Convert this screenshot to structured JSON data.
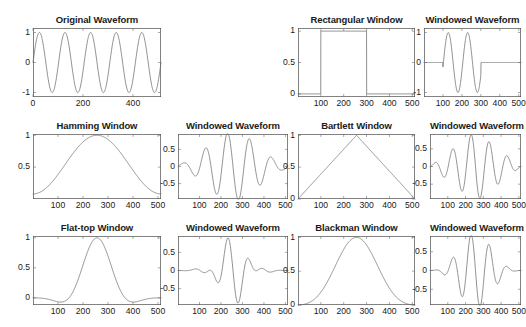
{
  "figure": {
    "background": "#ffffff",
    "line_color": "#6b6b6b",
    "axis_color": "#4d4d4d",
    "text_color": "#1a1a1a",
    "rows": 3,
    "cols": 4
  },
  "chart_data": [
    {
      "id": "original-waveform",
      "type": "line",
      "title": "Original Waveform",
      "xlabel": "",
      "ylabel": "",
      "xlim": [
        0,
        512
      ],
      "ylim": [
        -1.15,
        1.15
      ],
      "xticks": [
        0,
        200,
        400
      ],
      "xticklabels": [
        "0",
        "200",
        "400"
      ],
      "yticks": [
        -1,
        0,
        1
      ],
      "yticklabels": [
        "-1",
        "0",
        "1"
      ],
      "grid": false,
      "series": [
        {
          "name": "sine",
          "formula": "sin",
          "amplitude": 1.0,
          "cycles": 5,
          "phase": 0,
          "window": "none"
        }
      ]
    },
    {
      "id": "rectangular-window",
      "type": "line",
      "title": "Rectangular Window",
      "xlabel": "",
      "ylabel": "",
      "xlim": [
        0,
        512
      ],
      "ylim": [
        -0.05,
        1.05
      ],
      "xticks": [
        100,
        200,
        300,
        400,
        500
      ],
      "xticklabels": [
        "100",
        "200",
        "300",
        "400",
        "500"
      ],
      "yticks": [
        0,
        0.5,
        1
      ],
      "yticklabels": [
        "0",
        "0.5",
        "1"
      ],
      "grid": false,
      "series": [
        {
          "name": "rectangular",
          "formula": "window",
          "window": "rectangular",
          "start": 100,
          "stop": 300
        }
      ]
    },
    {
      "id": "rectangular-windowed-waveform",
      "type": "line",
      "title": "Windowed Waveform",
      "xlabel": "",
      "ylabel": "",
      "xlim": [
        0,
        512
      ],
      "ylim": [
        -1.15,
        1.15
      ],
      "xticks": [
        100,
        200,
        300,
        400,
        500
      ],
      "xticklabels": [
        "100",
        "200",
        "300",
        "400",
        "500"
      ],
      "yticks": [
        -1,
        0,
        1
      ],
      "yticklabels": [
        "-1",
        "0",
        "1"
      ],
      "grid": false,
      "series": [
        {
          "name": "sine-x-rectangular",
          "formula": "sin",
          "amplitude": 1.0,
          "cycles": 5,
          "phase": 0,
          "window": "rectangular",
          "start": 100,
          "stop": 300
        }
      ]
    },
    {
      "id": "hamming-window",
      "type": "line",
      "title": "Hamming Window",
      "xlabel": "",
      "ylabel": "",
      "xlim": [
        0,
        512
      ],
      "ylim": [
        0.0,
        1.02
      ],
      "xticks": [
        100,
        200,
        300,
        400,
        500
      ],
      "xticklabels": [
        "100",
        "200",
        "300",
        "400",
        "500"
      ],
      "yticks": [
        0.5,
        1
      ],
      "yticklabels": [
        "0.5",
        "1"
      ],
      "grid": false,
      "series": [
        {
          "name": "hamming",
          "formula": "window",
          "window": "hamming"
        }
      ]
    },
    {
      "id": "hamming-windowed-waveform",
      "type": "line",
      "title": "Windowed Waveform",
      "xlabel": "",
      "ylabel": "",
      "xlim": [
        0,
        512
      ],
      "ylim": [
        -0.95,
        0.95
      ],
      "xticks": [
        100,
        200,
        300,
        400,
        500
      ],
      "xticklabels": [
        "100",
        "200",
        "300",
        "400",
        "500"
      ],
      "yticks": [
        -0.5,
        0,
        0.5
      ],
      "yticklabels": [
        "-0.5",
        "0",
        "0.5"
      ],
      "grid": false,
      "series": [
        {
          "name": "sine-x-hamming",
          "formula": "sin",
          "amplitude": 1.0,
          "cycles": 5,
          "phase": 0,
          "window": "hamming"
        }
      ]
    },
    {
      "id": "bartlett-window",
      "type": "line",
      "title": "Bartlett Window",
      "xlabel": "",
      "ylabel": "",
      "xlim": [
        0,
        512
      ],
      "ylim": [
        0,
        1.02
      ],
      "xticks": [
        100,
        200,
        300,
        400,
        500
      ],
      "xticklabels": [
        "100",
        "200",
        "300",
        "400",
        "500"
      ],
      "yticks": [
        0,
        0.5,
        1
      ],
      "yticklabels": [
        "0",
        "0.5",
        "1"
      ],
      "grid": false,
      "series": [
        {
          "name": "bartlett",
          "formula": "window",
          "window": "bartlett"
        }
      ]
    },
    {
      "id": "bartlett-windowed-waveform",
      "type": "line",
      "title": "Windowed Waveform",
      "xlabel": "",
      "ylabel": "",
      "xlim": [
        0,
        512
      ],
      "ylim": [
        -0.92,
        0.92
      ],
      "xticks": [
        100,
        200,
        300,
        400,
        500
      ],
      "xticklabels": [
        "100",
        "200",
        "300",
        "400",
        "500"
      ],
      "yticks": [
        -0.5,
        0,
        0.5
      ],
      "yticklabels": [
        "-0.5",
        "0",
        "0.5"
      ],
      "grid": false,
      "series": [
        {
          "name": "sine-x-bartlett",
          "formula": "sin",
          "amplitude": 1.0,
          "cycles": 5,
          "phase": 0,
          "window": "bartlett"
        }
      ]
    },
    {
      "id": "flat-top-window",
      "type": "line",
      "title": "Flat-top Window",
      "xlabel": "",
      "ylabel": "",
      "xlim": [
        0,
        512
      ],
      "ylim": [
        -0.12,
        1.03
      ],
      "xticks": [
        100,
        200,
        300,
        400,
        500
      ],
      "xticklabels": [
        "100",
        "200",
        "300",
        "400",
        "500"
      ],
      "yticks": [
        0,
        0.5,
        1
      ],
      "yticklabels": [
        "0",
        "0.5",
        "1"
      ],
      "grid": false,
      "series": [
        {
          "name": "flattop",
          "formula": "window",
          "window": "flattop"
        }
      ]
    },
    {
      "id": "flattop-windowed-waveform",
      "type": "line",
      "title": "Windowed Waveform",
      "xlabel": "",
      "ylabel": "",
      "xlim": [
        0,
        512
      ],
      "ylim": [
        -0.95,
        0.95
      ],
      "xticks": [
        100,
        200,
        300,
        400,
        500
      ],
      "xticklabels": [
        "100",
        "200",
        "300",
        "400",
        "500"
      ],
      "yticks": [
        -0.5,
        0,
        0.5
      ],
      "yticklabels": [
        "-0.5",
        "0",
        "0.5"
      ],
      "grid": false,
      "series": [
        {
          "name": "sine-x-flattop",
          "formula": "sin",
          "amplitude": 1.0,
          "cycles": 5,
          "phase": 0,
          "window": "flattop"
        }
      ]
    },
    {
      "id": "blackman-window",
      "type": "line",
      "title": "Blackman Window",
      "xlabel": "",
      "ylabel": "",
      "xlim": [
        0,
        512
      ],
      "ylim": [
        0,
        1.02
      ],
      "xticks": [
        100,
        200,
        300,
        400,
        500
      ],
      "xticklabels": [
        "100",
        "200",
        "300",
        "400",
        "500"
      ],
      "yticks": [
        0,
        0.5,
        1
      ],
      "yticklabels": [
        "0",
        "0.5",
        "1"
      ],
      "grid": false,
      "series": [
        {
          "name": "blackman",
          "formula": "window",
          "window": "blackman"
        }
      ]
    },
    {
      "id": "blackman-windowed-waveform",
      "type": "line",
      "title": "Windowed Waveform",
      "xlabel": "",
      "ylabel": "",
      "xlim": [
        0,
        512
      ],
      "ylim": [
        -0.92,
        0.92
      ],
      "xticks": [
        100,
        200,
        300,
        400,
        500
      ],
      "xticklabels": [
        "100",
        "200",
        "300",
        "400",
        "500"
      ],
      "yticks": [
        -0.5,
        0,
        0.5
      ],
      "yticklabels": [
        "-0.5",
        "0",
        "0.5"
      ],
      "grid": false,
      "series": [
        {
          "name": "sine-x-blackman",
          "formula": "sin",
          "amplitude": 1.0,
          "cycles": 5,
          "phase": 0,
          "window": "blackman"
        }
      ]
    }
  ],
  "layout": {
    "cells": [
      {
        "chart": 0,
        "left": 33,
        "top": 14,
        "width": 128,
        "height": 96,
        "empty": false
      },
      {
        "chart": null,
        "left": 166,
        "top": 14,
        "width": 128,
        "height": 96,
        "empty": true
      },
      {
        "chart": 1,
        "left": 298,
        "top": 14,
        "width": 117,
        "height": 96,
        "empty": false
      },
      {
        "chart": 2,
        "left": 424,
        "top": 14,
        "width": 97,
        "height": 96,
        "empty": false
      },
      {
        "chart": 3,
        "left": 33,
        "top": 120,
        "width": 128,
        "height": 92,
        "empty": false
      },
      {
        "chart": 4,
        "left": 178,
        "top": 120,
        "width": 110,
        "height": 92,
        "empty": false
      },
      {
        "chart": 5,
        "left": 298,
        "top": 120,
        "width": 117,
        "height": 92,
        "empty": false
      },
      {
        "chart": 6,
        "left": 430,
        "top": 120,
        "width": 91,
        "height": 92,
        "empty": false
      },
      {
        "chart": 7,
        "left": 33,
        "top": 222,
        "width": 128,
        "height": 96,
        "empty": false
      },
      {
        "chart": 8,
        "left": 178,
        "top": 222,
        "width": 110,
        "height": 96,
        "empty": false
      },
      {
        "chart": 9,
        "left": 298,
        "top": 222,
        "width": 117,
        "height": 96,
        "empty": false
      },
      {
        "chart": 10,
        "left": 430,
        "top": 222,
        "width": 91,
        "height": 96,
        "empty": false
      }
    ]
  }
}
